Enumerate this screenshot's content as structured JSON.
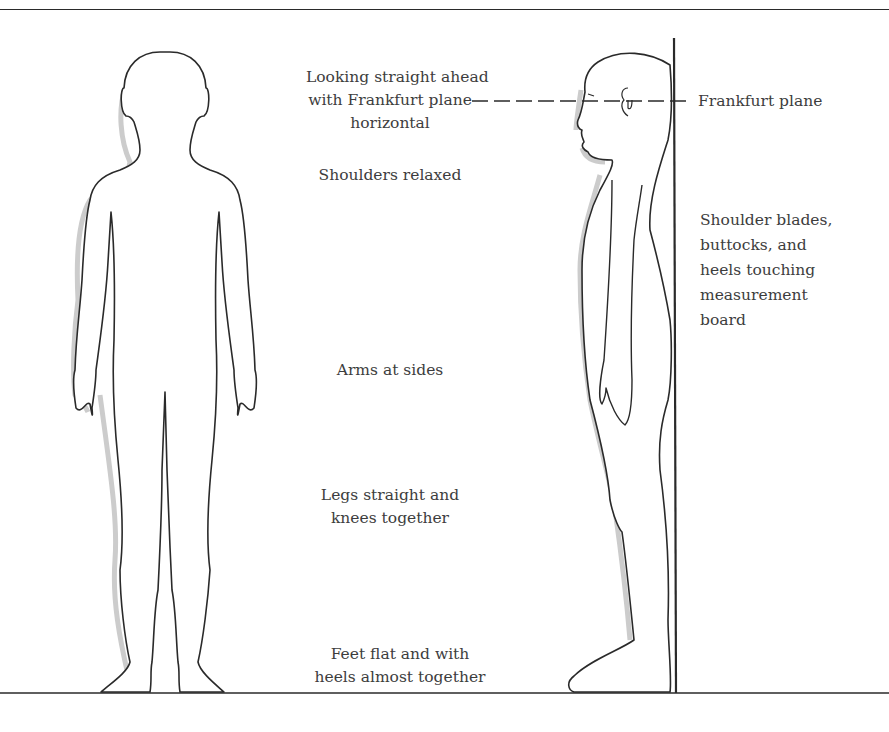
{
  "diagram": {
    "type": "anatomical posture illustration",
    "figures": [
      "front-view child silhouette",
      "side-view child silhouette against measurement board"
    ],
    "labels": {
      "head": [
        "Looking straight ahead",
        "with Frankfurt plane",
        "horizontal"
      ],
      "shoulders": [
        "Shoulders relaxed"
      ],
      "arms": [
        "Arms at sides"
      ],
      "legs": [
        "Legs straight and",
        "knees together"
      ],
      "feet": [
        "Feet flat and with",
        "heels almost together"
      ],
      "frankfurt": [
        "Frankfurt plane"
      ],
      "board": [
        "Shoulder blades,",
        "buttocks, and",
        "heels touching",
        "measurement",
        "board"
      ]
    },
    "colors": {
      "outline": "#2a2a2a",
      "shadow": "#c8c8c8",
      "text": "#3d3d3d",
      "background": "#ffffff"
    }
  }
}
